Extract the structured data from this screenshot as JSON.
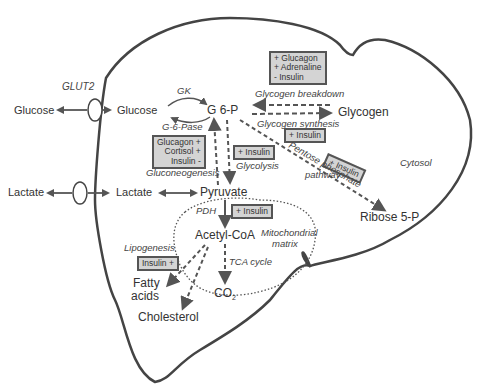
{
  "diagram": {
    "compartments": {
      "cytosol": "Cytosol",
      "mitochondrial_matrix_1": "Mitochondrial",
      "mitochondrial_matrix_2": "matrix"
    },
    "transporter": "GLUT2",
    "metabolites": {
      "glucose_out": "Glucose",
      "glucose_in": "Glucose",
      "g6p": "G 6-P",
      "glycogen": "Glycogen",
      "lactate_out": "Lactate",
      "lactate_in": "Lactate",
      "pyruvate": "Pyruvate",
      "acetyl_coa": "Acetyl-CoA",
      "ribose5p": "Ribose 5-P",
      "fatty_acids_1": "Fatty",
      "fatty_acids_2": "acids",
      "cholesterol": "Cholesterol",
      "co2": "CO",
      "co2_sub": "2"
    },
    "enzymes": {
      "gk": "GK",
      "g6pase": "G-6-Pase",
      "pdh": "PDH"
    },
    "pathways": {
      "glycogen_breakdown": "Glycogen breakdown",
      "glycogen_synthesis": "Glycogen synthesis",
      "gluconeogenesis": "Gluconeogenesis",
      "glycolysis": "Glycolysis",
      "pentose_1": "Pentose phosphate",
      "pentose_2": "pathway",
      "tca": "TCA cycle",
      "lipogenesis": "Lipogenesis"
    },
    "regulation_boxes": {
      "glycogen_breakdown": [
        "+ Glucagon",
        "+ Adrenaline",
        "- Insulin"
      ],
      "glycogen_synthesis": [
        "+ Insulin"
      ],
      "gluconeogenesis": [
        "Glucagon +",
        "Cortisol +",
        "Insulin -"
      ],
      "glycolysis": [
        "+ Insulin"
      ],
      "pentose": [
        "+ Insulin"
      ],
      "pdh": [
        "+ Insulin"
      ],
      "lipogenesis": [
        "Insulin +"
      ]
    },
    "colors": {
      "outline": "#444444",
      "box_fill": "#d4d4d4",
      "arrow": "#555555"
    }
  }
}
